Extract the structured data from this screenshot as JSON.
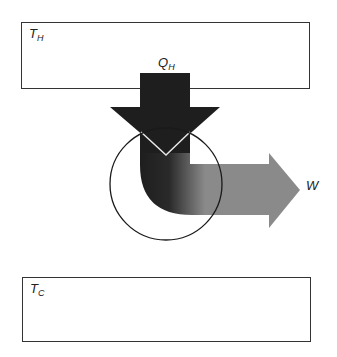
{
  "diagram": {
    "type": "heat-engine",
    "hot_reservoir": {
      "label_main": "T",
      "label_sub": "H"
    },
    "cold_reservoir": {
      "label_main": "T",
      "label_sub": "C"
    },
    "heat_in": {
      "label_main": "Q",
      "label_sub": "H"
    },
    "work_out": {
      "label_main": "W"
    },
    "engine": {
      "shape": "circle"
    },
    "colors": {
      "heat_arrow": "#1e1e1e",
      "work_arrow": "#8a8a8a",
      "outline": "#333333",
      "background": "#ffffff"
    }
  }
}
